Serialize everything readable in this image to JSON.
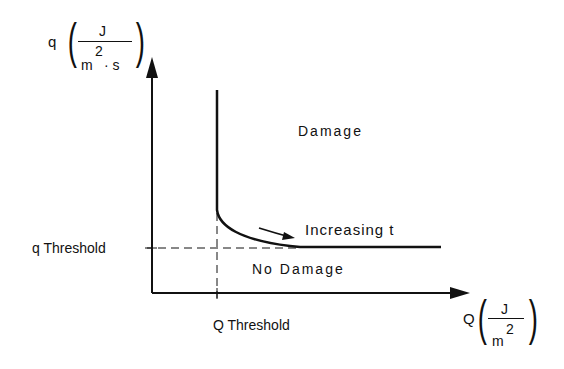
{
  "diagram": {
    "y_axis": {
      "symbol": "q",
      "unit_num": "J",
      "unit_den": "m",
      "unit_den_exp": "2",
      "unit_den_extra": "· s"
    },
    "x_axis": {
      "symbol": "Q",
      "unit_num": "J",
      "unit_den": "m",
      "unit_den_exp": "2"
    },
    "regions": {
      "above": "Damage",
      "below": "No Damage"
    },
    "curve_annotation": "Increasing t",
    "q_threshold_label": "q Threshold",
    "Q_threshold_label": "Q Threshold"
  }
}
